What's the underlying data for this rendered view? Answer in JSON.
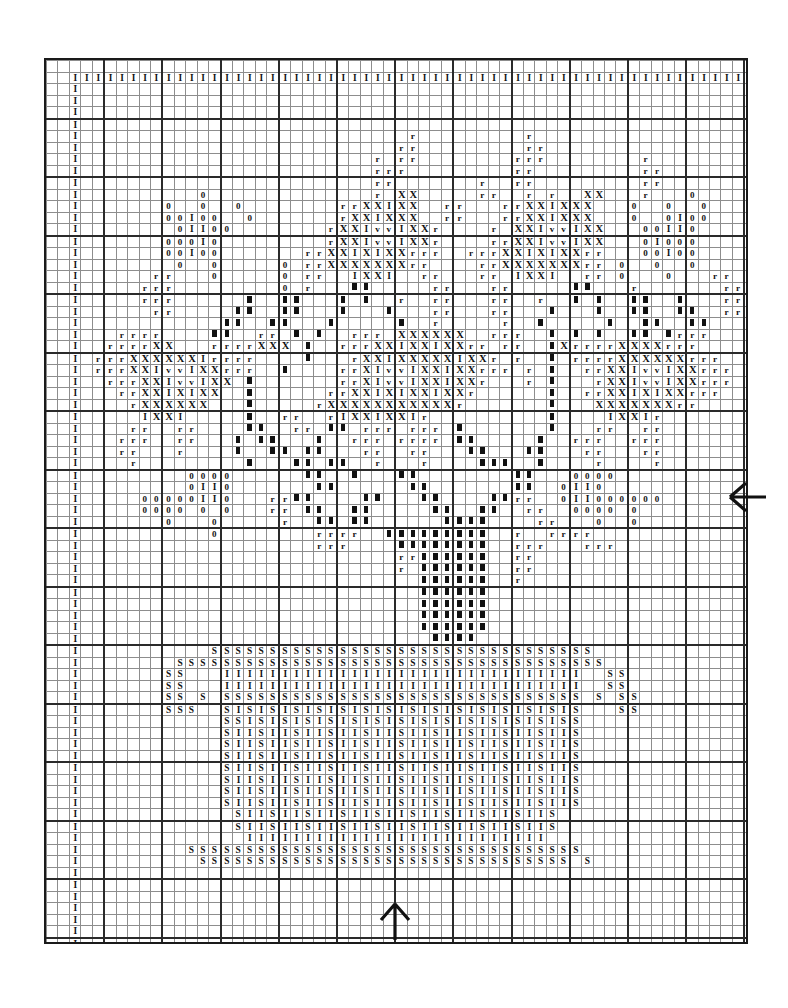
{
  "chart": {
    "type": "cross-stitch-grid",
    "columns": 67,
    "rows": 84,
    "cell_size_px": 10.45,
    "bold_gridline_every": 5,
    "grid_line_color": "#8d8d8d",
    "bold_grid_line_color": "#2a2a2a",
    "symbol_color": "#111111",
    "background_color": "#ffffff",
    "symbols": {
      "I": "I",
      "X": "X",
      "v": "v",
      "r": "r",
      "0": "0",
      "S": "S",
      "B": "solid-block"
    },
    "symbol_legend": [
      {
        "key": "I",
        "glyph": "I",
        "name": "light-stitch"
      },
      {
        "key": "X",
        "glyph": "X",
        "name": "dark-cross-stitch"
      },
      {
        "key": "v",
        "glyph": "v",
        "name": "accent-stitch"
      },
      {
        "key": "r",
        "glyph": "r",
        "name": "outline-stitch"
      },
      {
        "key": "0",
        "glyph": "0",
        "name": "pale-stitch"
      },
      {
        "key": "S",
        "glyph": "S",
        "name": "basket-weave-stitch"
      },
      {
        "key": "B",
        "glyph": "▌",
        "name": "solid-fill-stitch"
      }
    ],
    "markers": {
      "bottom_center_arrow": {
        "name": "center-marker-bottom",
        "column": 33,
        "direction": "up"
      },
      "right_center_arrow": {
        "name": "center-marker-right",
        "row": 40,
        "direction": "left"
      }
    },
    "rows_data": [
      "...................................................................",
      "..IIIIIIIIIIIIIIIIIIIIIIIIIIIIIIIIIIIIIIIIIIIIIIIIIIIIIIIIIIIII..",
      "..I...........................................................I..",
      "..I...........................................................I..",
      "..I...........................................................I..",
      "..I...........................................................I..",
      "..I............................r.........r....................I..",
      "..I...........................rr.........rr...................I..",
      "..I.........................r.rr........rrr........r..........I..",
      "..I.........................rrr.........rr.........rr.........I..",
      "..I.........................rr.......r..rr.........rr.........I..",
      "..I..........0..............r.XX.....rr..r.r..XX...r...0......I..",
      "..I.......0..0..0........rrXXIXX..rr...rrXXIXXX...0..0..0.....I..",
      "..I.......00I00..0.......rXXIXXX..rr...rrXXIXXX...0..0I00.....I..",
      "..I........0II00........rXXIvvIXXr....r.XXIvvIXX...00II0......I..",
      "..I.......000I0.........rXXIvvIXXr....rrXXIvvIXX...0I000......I..",
      "..I.......00I00.......rrXXIXIXXrrr..rrrXXIXIXXrr...00I00......I..",
      "..I........0..0.....0.rrXXXXXXXrr....rrXXXXXXXrr.0..0..0......I..",
      "..I......rr...0.....0.rr..IXXI..rr...rr.IXXI..rr.0...0...rr...I..",
      "..I.....rrr.........0.r...BB.....rr...rr.....BB...r.......rrr..I.",
      "..I.....rrr......B..BB...B.B..r..rr...rr..r..B.B..BB..B...rrr..I.",
      "..I......rr.....BB..BB...B...B...rr...rr...B...B..BB..BB..rr..I..",
      "..I............BB..BB...B.....B..r.....r..B.....B..BB..BB.....I..",
      "..I...rrrr....BB..rr.B.B..rrr.XXXXXX..rrr..B.B.B..BB.Brrr.....I..",
      "..I..rrrrXX...rrrrXXX.B..rrrXXIXXIXXrr.rr..BXrrrrXXXXrrr......I..",
      "..I.rrrXXXXXXIrrrr....B...rXXIXXXXXIXXr.r..B.rrrrXXXXXXrrr....I..",
      "..I.rrrXXIvvIXXrrr..B....rrXIvvIXXIXXrrr.r.B..rrXXIvvIXXrrr...I..",
      "..I..rrrXXIvvIXX.B.......rrXIvvIXXIXXr...r.B...rXXIvvIXXrrr...I..",
      "..I...rrXXIXIXX..B......rrXXIXIXXIXXr......B..rrXXIXIXXrrr....I..",
      "..I....rXXXXXX...B.....rXXXXXXXXXXXr.......B...XXXXXXXrr......I..",
      "..I.....IXXI.....B..rr..rIXXIXXIr..........B....IXXIr.........I..",
      "..I....rr..rr....BB..rr.BB.rrr.rrr.B.......B...rr..rr.........I..",
      "..I...rrr..rr...B.BB...B..rrr.rrrr.BB.....B..rrr..rrr.........I..",
      "..I...rr...r....B..BB.BB...rr..rr...BB...BB...rr...rr.........I..",
      "..I....r.........B...BB.BB..r...r....BBB..B....r....r.........I..",
      "..I.........0000......BB..B...BB........BB...0000.............I..",
      "..I.........0II0.......BB......BB.......BB..0II0..............I..",
      "..I.....00000II0...rrBB....BB...BB....BBrr..0II000000.........I..",
      "..I.....0000.0.0...rr.BB..BB.....BB..BB..rr..0000.0...........I..",
      "..I.......0...0.....r..BB.BB......BBBB....rr...0..0...........I..",
      "..I...........0........rrrr..BBBBBBBBB..r..rrrr...............I..",
      "..I....................rrr....BBBBBBBB..rrr...rrr.............I..",
      "..I...........................rrBBBBBB..rr....................I..",
      "..I...........................r.BBBBBB..rr....................I..",
      "..I.............................BBBBBB..r.....................I..",
      "..I.............................BBBBBB........................I..",
      "..I.............................BBBBBB........................I..",
      "..I.............................BBBBBB........................I..",
      "..I.............................BBBBBB........................I..",
      "..I..............................BBBB.........................I..",
      "..I...........SSSSSSSSSSSSSSSSSSSSSSSSSSSSSSSSS...............I..",
      "..I........SSSSSSSSSSSSSSSSSSSSSSSSSSSSSSSSSSSSS.............I...",
      "..I.......SS...IIIIIIIIIIIIIIIIIIIIIIIIIIIIIII..SS............I..",
      "..I.......SS...IIIIIIIIIIIIIIIIIIIIIIIIIIIIIII..SS............I..",
      "..I.......SS.S.SSSSSSSSSSSSSSSSSSSSSSSSSSSSSSS.S.SS...........I..",
      "..I.......SSS..SISISISISISISISISISISISISISISIS...SS...........I..",
      "..I............SSISISISISISISISISISISISISISISS................I..",
      "..I............SIISIISIISIISIISIISIISIISIISIIS................I..",
      "..I............SIISIISIISIISIISIISIISIISIISIIS................I..",
      "..I............SIISIISIISIISIISIISIISIISIISIIS................I..",
      "..I............SIISIISIISIISIISIISIISIISIISIIS................I..",
      "..I............SIISIISIISIISIISIISIISIISIISIIS................I..",
      "..I............SIISIISIISIISIISIISIISIISIISIIS................I..",
      "..I............SIISIISIISIISIISIISIISIISIISIIS................I..",
      "..I.............SIISIISIISIISIISIISIISIISIIS..................I..",
      "..I.............SIISIISIISIISIISIISIISIISIIS..................I..",
      "..I..............IIIIIIIIIIIIIIIIIIIIIIIIII...................I..",
      "..I.........SSSSSSSSSSSSSSSSSSSSSSSSSSSSSSSSSS................I..",
      "..I..........SSSSSSSSSSSSSSSSSSSSSSSSSSSSSSSS.S...............I..",
      "..I...........................................................I..",
      "..I...........................................................I..",
      "..I...........................................................I..",
      "..I...........................................................I..",
      "..I...........................................................I..",
      "..I...........................................................I..",
      "..I...........................................................I..",
      "..I...........................................................I..",
      "..I...........................................................I..",
      "..I...........................................................I..",
      "..I...........................................................I..",
      "..I...........................................................I..",
      "..IIIIIIIIIIIIIIIIIIIIIIIIIIIIIIIIIIIIIIIIIIIIIIIIIIIIIIIIIIIII..",
      "...................................................................",
      "..................................................................."
    ]
  }
}
